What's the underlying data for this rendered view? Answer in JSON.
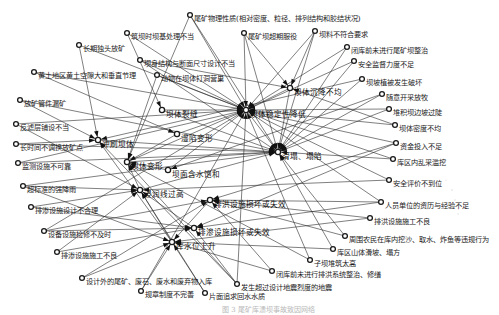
{
  "diagram": {
    "type": "directed-network",
    "caption": "图 3 尾矿库溃坝事故致因网络",
    "hubs": [
      {
        "id": "h1",
        "label": "坝体稳定性降低",
        "x": 246,
        "y": 110
      },
      {
        "id": "h2",
        "label": "滑塌、塌陷",
        "x": 278,
        "y": 152
      },
      {
        "id": "h3",
        "label": "冲刷坝体",
        "x": 98,
        "y": 140
      },
      {
        "id": "h4",
        "label": "坝体变形",
        "x": 127,
        "y": 162
      },
      {
        "id": "h5",
        "label": "浸润线过高",
        "x": 140,
        "y": 190
      },
      {
        "id": "h6",
        "label": "库水位上升",
        "x": 172,
        "y": 242
      },
      {
        "id": "h7",
        "label": "排洪设施损坏或失效",
        "x": 210,
        "y": 200
      },
      {
        "id": "h8",
        "label": "排渗设施损坏或失效",
        "x": 194,
        "y": 228
      },
      {
        "id": "h9",
        "label": "坝体裂缝",
        "x": 162,
        "y": 110
      },
      {
        "id": "h10",
        "label": "湿陷变形",
        "x": 177,
        "y": 134
      },
      {
        "id": "h11",
        "label": "坝面含水饱和",
        "x": 168,
        "y": 170
      },
      {
        "id": "h12",
        "label": "坝体沉降不均",
        "x": 290,
        "y": 88
      }
    ],
    "nodes": [
      {
        "id": "n1",
        "label": "尾矿物理性质(相对密度、粒径、排列结构和胶结状况)",
        "x": 190,
        "y": 15
      },
      {
        "id": "n2",
        "label": "筑坝时坝基处理不当",
        "x": 127,
        "y": 33
      },
      {
        "id": "n3",
        "label": "尾矿坝超期服役",
        "x": 244,
        "y": 33
      },
      {
        "id": "n4",
        "label": "坝料不符合要求",
        "x": 315,
        "y": 31
      },
      {
        "id": "n5",
        "label": "长期独头放矿",
        "x": 79,
        "y": 45
      },
      {
        "id": "n6",
        "label": "坝身结构与断面尺寸设计不当",
        "x": 140,
        "y": 60
      },
      {
        "id": "n7",
        "label": "闭库前未进行尾矿坝整治",
        "x": 347,
        "y": 47
      },
      {
        "id": "n8",
        "label": "动物在坝体打洞营巢",
        "x": 157,
        "y": 75
      },
      {
        "id": "n9",
        "label": "安全监督力度不足",
        "x": 354,
        "y": 61
      },
      {
        "id": "n10",
        "label": "黄土地区黄土空隙大和垂直节理",
        "x": 34,
        "y": 72
      },
      {
        "id": "n11",
        "label": "坝坡植被发生破坏",
        "x": 362,
        "y": 79
      },
      {
        "id": "n12",
        "label": "放矿管件漏矿",
        "x": 20,
        "y": 100
      },
      {
        "id": "n13",
        "label": "随意开采放牧",
        "x": 382,
        "y": 94
      },
      {
        "id": "n14",
        "label": "堆积坝边坡过陡",
        "x": 389,
        "y": 109
      },
      {
        "id": "n15",
        "label": "反滤层铺设不当",
        "x": 16,
        "y": 124
      },
      {
        "id": "n16",
        "label": "坝体密度不均",
        "x": 395,
        "y": 125
      },
      {
        "id": "n17",
        "label": "长时间不调换放矿点",
        "x": 16,
        "y": 144
      },
      {
        "id": "n18",
        "label": "资金投入不足",
        "x": 396,
        "y": 143
      },
      {
        "id": "n19",
        "label": "监测设施不可靠",
        "x": 18,
        "y": 163
      },
      {
        "id": "n20",
        "label": "库区内乱采滥挖",
        "x": 393,
        "y": 159
      },
      {
        "id": "n21",
        "label": "超标准的强降雨",
        "x": 23,
        "y": 186
      },
      {
        "id": "n22",
        "label": "安全评价不到位",
        "x": 389,
        "y": 180
      },
      {
        "id": "n23",
        "label": "排渗设施设计不合理",
        "x": 31,
        "y": 207
      },
      {
        "id": "n24",
        "label": "人员单位的资历与经验不足",
        "x": 381,
        "y": 202
      },
      {
        "id": "n25",
        "label": "设备设施检修不及时",
        "x": 44,
        "y": 231
      },
      {
        "id": "n26",
        "label": "排洪设施施工不良",
        "x": 370,
        "y": 218
      },
      {
        "id": "n27",
        "label": "排渗设施施工不良",
        "x": 57,
        "y": 252
      },
      {
        "id": "n28",
        "label": "周围农民在库内挖沙、取水、炸鱼等违规行为",
        "x": 345,
        "y": 236
      },
      {
        "id": "n29",
        "label": "库区山体滑坡、塌方",
        "x": 333,
        "y": 249
      },
      {
        "id": "n30",
        "label": "子坝堆筑太高",
        "x": 310,
        "y": 260
      },
      {
        "id": "n31",
        "label": "设计外的尾矿、废石、废水和废弃物入库",
        "x": 82,
        "y": 278
      },
      {
        "id": "n32",
        "label": "闭库前未进行排洪系统整治、修缮",
        "x": 272,
        "y": 271
      },
      {
        "id": "n33",
        "label": "发生超过设计地震烈度的地震",
        "x": 237,
        "y": 284
      },
      {
        "id": "n34",
        "label": "规章制度不完善",
        "x": 141,
        "y": 291
      },
      {
        "id": "n35",
        "label": "片面追求回水水质",
        "x": 205,
        "y": 293
      }
    ],
    "edges": [
      [
        "n1",
        "h1"
      ],
      [
        "n1",
        "h2"
      ],
      [
        "n1",
        "h4"
      ],
      [
        "n2",
        "h1"
      ],
      [
        "n2",
        "h9"
      ],
      [
        "n3",
        "h1"
      ],
      [
        "n3",
        "h2"
      ],
      [
        "n3",
        "h12"
      ],
      [
        "n4",
        "h1"
      ],
      [
        "n4",
        "h2"
      ],
      [
        "n4",
        "h12"
      ],
      [
        "n5",
        "h3"
      ],
      [
        "n5",
        "h1"
      ],
      [
        "n6",
        "h1"
      ],
      [
        "n6",
        "h2"
      ],
      [
        "n6",
        "h12"
      ],
      [
        "n7",
        "h1"
      ],
      [
        "n7",
        "h2"
      ],
      [
        "n8",
        "h1"
      ],
      [
        "n8",
        "h4"
      ],
      [
        "n9",
        "h1"
      ],
      [
        "n9",
        "h2"
      ],
      [
        "n10",
        "h1"
      ],
      [
        "n10",
        "h10"
      ],
      [
        "n11",
        "h2"
      ],
      [
        "n11",
        "h3"
      ],
      [
        "n12",
        "h3"
      ],
      [
        "n12",
        "h2"
      ],
      [
        "n13",
        "h2"
      ],
      [
        "n13",
        "h11"
      ],
      [
        "n14",
        "h1"
      ],
      [
        "n14",
        "h2"
      ],
      [
        "n15",
        "h5"
      ],
      [
        "n15",
        "h1"
      ],
      [
        "n16",
        "h1"
      ],
      [
        "n16",
        "h12"
      ],
      [
        "n17",
        "h3"
      ],
      [
        "n17",
        "h2"
      ],
      [
        "n18",
        "h7"
      ],
      [
        "n18",
        "h8"
      ],
      [
        "n18",
        "h1"
      ],
      [
        "n19",
        "h1"
      ],
      [
        "n19",
        "h2"
      ],
      [
        "n20",
        "h2"
      ],
      [
        "n20",
        "h1"
      ],
      [
        "n21",
        "h6"
      ],
      [
        "n21",
        "h5"
      ],
      [
        "n21",
        "h2"
      ],
      [
        "n22",
        "h1"
      ],
      [
        "n22",
        "h5"
      ],
      [
        "n23",
        "h5"
      ],
      [
        "n23",
        "h8"
      ],
      [
        "n24",
        "h7"
      ],
      [
        "n24",
        "h8"
      ],
      [
        "n24",
        "h1"
      ],
      [
        "n25",
        "h7"
      ],
      [
        "n25",
        "h8"
      ],
      [
        "n25",
        "h1"
      ],
      [
        "n26",
        "h7"
      ],
      [
        "n26",
        "h6"
      ],
      [
        "n27",
        "h8"
      ],
      [
        "n27",
        "h5"
      ],
      [
        "n28",
        "h2"
      ],
      [
        "n28",
        "h7"
      ],
      [
        "n29",
        "h6"
      ],
      [
        "n29",
        "h2"
      ],
      [
        "n30",
        "h1"
      ],
      [
        "n30",
        "h4"
      ],
      [
        "n31",
        "h6"
      ],
      [
        "n31",
        "h7"
      ],
      [
        "n32",
        "h6"
      ],
      [
        "n32",
        "h7"
      ],
      [
        "n33",
        "h1"
      ],
      [
        "n33",
        "h4"
      ],
      [
        "n33",
        "h3"
      ],
      [
        "n33",
        "h8"
      ],
      [
        "n34",
        "h1"
      ],
      [
        "n34",
        "h6"
      ],
      [
        "n35",
        "h6"
      ],
      [
        "n35",
        "h5"
      ],
      [
        "h1",
        "h2"
      ],
      [
        "h3",
        "h2"
      ],
      [
        "h4",
        "h1"
      ],
      [
        "h4",
        "h2"
      ],
      [
        "h5",
        "h4"
      ],
      [
        "h5",
        "h2"
      ],
      [
        "h6",
        "h3"
      ],
      [
        "h6",
        "h5"
      ],
      [
        "h7",
        "h6"
      ],
      [
        "h8",
        "h5"
      ],
      [
        "h9",
        "h1"
      ],
      [
        "h9",
        "h2"
      ],
      [
        "h10",
        "h4"
      ],
      [
        "h10",
        "h1"
      ],
      [
        "h11",
        "h4"
      ],
      [
        "h11",
        "h1"
      ],
      [
        "h12",
        "h1"
      ],
      [
        "h12",
        "h2"
      ]
    ]
  }
}
